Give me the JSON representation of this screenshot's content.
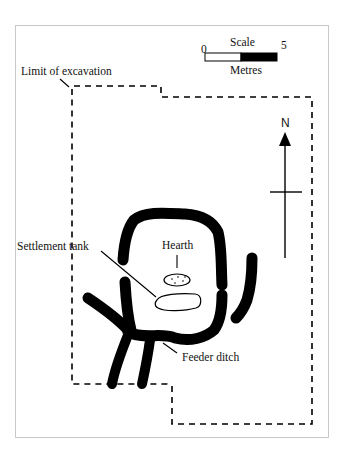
{
  "scale": {
    "title": "Scale",
    "start_label": "0",
    "end_label": "5",
    "unit": "Metres"
  },
  "north_arrow": {
    "label": "N"
  },
  "labels": {
    "limit_of_excavation": "Limit of excavation",
    "settlement_tank": "Settlement tank",
    "hearth": "Hearth",
    "feeder_ditch": "Feeder ditch"
  },
  "colors": {
    "ink": "#000000",
    "frame": "#c8c8c8",
    "background": "#ffffff"
  }
}
